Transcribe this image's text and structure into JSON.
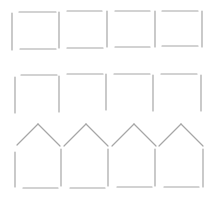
{
  "diagram": {
    "title": "",
    "stroke_color": "#a6a6a6",
    "background": "#ffffff",
    "rows": [
      {
        "name": "squares-row",
        "shape": "square",
        "count": 4,
        "segments": [
          [
            12,
            13,
            12,
            50
          ],
          [
            19,
            12,
            56,
            12
          ],
          [
            20,
            49,
            56,
            49
          ],
          [
            59,
            12,
            59,
            48
          ],
          [
            67,
            11,
            102,
            11
          ],
          [
            67,
            48,
            103,
            48
          ],
          [
            107,
            11,
            107,
            47
          ],
          [
            115,
            11,
            150,
            11
          ],
          [
            115,
            47,
            150,
            47
          ],
          [
            155,
            11,
            155,
            47
          ],
          [
            162,
            11,
            198,
            11
          ],
          [
            162,
            46,
            198,
            46
          ],
          [
            202,
            11,
            202,
            47
          ]
        ]
      },
      {
        "name": "open-squares-row",
        "shape": "square-open-bottom",
        "count": 4,
        "segments": [
          [
            15,
            77,
            15,
            113
          ],
          [
            21,
            75,
            57,
            75
          ],
          [
            59,
            76,
            59,
            112
          ],
          [
            67,
            74,
            103,
            74
          ],
          [
            106,
            74,
            106,
            110
          ],
          [
            114,
            74,
            150,
            74
          ],
          [
            153,
            75,
            153,
            111
          ],
          [
            161,
            74,
            197,
            74
          ],
          [
            201,
            75,
            201,
            111
          ]
        ]
      },
      {
        "name": "houses-row",
        "shape": "house",
        "count": 4,
        "segments": [
          [
            17,
            145,
            38,
            124
          ],
          [
            38,
            124,
            60,
            146
          ],
          [
            64,
            146,
            86,
            124
          ],
          [
            86,
            124,
            108,
            146
          ],
          [
            112,
            146,
            134,
            124
          ],
          [
            134,
            124,
            156,
            146
          ],
          [
            159,
            146,
            181,
            124
          ],
          [
            181,
            124,
            203,
            146
          ],
          [
            15,
            152,
            15,
            187
          ],
          [
            61,
            149,
            61,
            186
          ],
          [
            108,
            149,
            108,
            186
          ],
          [
            155,
            149,
            155,
            186
          ],
          [
            203,
            149,
            203,
            187
          ],
          [
            23,
            188,
            58,
            188
          ],
          [
            70,
            188,
            105,
            188
          ],
          [
            117,
            187,
            152,
            187
          ],
          [
            164,
            187,
            199,
            187
          ]
        ]
      }
    ]
  }
}
